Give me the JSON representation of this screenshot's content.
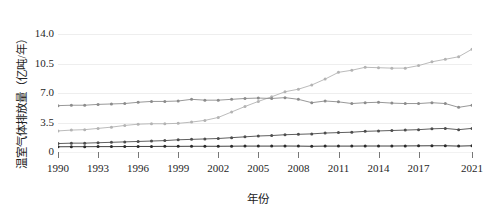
{
  "chart_data": {
    "type": "line",
    "title": "",
    "xlabel": "年份",
    "ylabel": "温室气体排放量（亿吨/年）",
    "x": [
      1990,
      1991,
      1992,
      1993,
      1994,
      1995,
      1996,
      1997,
      1998,
      1999,
      2000,
      2001,
      2002,
      2003,
      2004,
      2005,
      2006,
      2007,
      2008,
      2009,
      2010,
      2011,
      2012,
      2013,
      2014,
      2015,
      2016,
      2017,
      2018,
      2019,
      2020,
      2021
    ],
    "xlim": [
      1990,
      2021
    ],
    "ylim": [
      0,
      14
    ],
    "yticks": [
      "0",
      "3.5",
      "7.0",
      "10.5",
      "14.0"
    ],
    "ytick_values": [
      0,
      3.5,
      7.0,
      10.5,
      14.0
    ],
    "xticks": [
      "1990",
      "1993",
      "1996",
      "1999",
      "2002",
      "2005",
      "2008",
      "2011",
      "2014",
      "2017",
      "2021"
    ],
    "xtick_values": [
      1990,
      1993,
      1996,
      1999,
      2002,
      2005,
      2008,
      2011,
      2014,
      2017,
      2021
    ],
    "grid": true,
    "grid_axis": "y",
    "legend": "none",
    "marker": "circle",
    "series": [
      {
        "name": "series-1",
        "color": "#b3b3b3",
        "values": [
          2.5,
          2.6,
          2.65,
          2.8,
          2.95,
          3.15,
          3.3,
          3.35,
          3.35,
          3.4,
          3.55,
          3.75,
          4.1,
          4.75,
          5.4,
          6.0,
          6.55,
          7.15,
          7.45,
          7.95,
          8.65,
          9.45,
          9.7,
          10.05,
          10.0,
          9.95,
          9.95,
          10.25,
          10.7,
          11.0,
          11.3,
          12.2
        ]
      },
      {
        "name": "series-2",
        "color": "#8c8c8c",
        "values": [
          5.5,
          5.55,
          5.55,
          5.65,
          5.7,
          5.75,
          5.9,
          6.0,
          6.0,
          6.05,
          6.25,
          6.15,
          6.15,
          6.25,
          6.35,
          6.4,
          6.35,
          6.45,
          6.25,
          5.85,
          6.05,
          5.95,
          5.75,
          5.85,
          5.9,
          5.8,
          5.75,
          5.75,
          5.85,
          5.75,
          5.3,
          5.55
        ]
      },
      {
        "name": "series-3",
        "color": "#4d4d4d",
        "values": [
          1.0,
          1.05,
          1.05,
          1.1,
          1.15,
          1.2,
          1.25,
          1.3,
          1.35,
          1.45,
          1.5,
          1.55,
          1.6,
          1.7,
          1.8,
          1.9,
          1.95,
          2.05,
          2.1,
          2.15,
          2.25,
          2.3,
          2.35,
          2.45,
          2.5,
          2.55,
          2.6,
          2.65,
          2.75,
          2.8,
          2.65,
          2.8
        ]
      },
      {
        "name": "series-4",
        "color": "#2b2b2b",
        "values": [
          0.62,
          0.63,
          0.63,
          0.64,
          0.64,
          0.65,
          0.66,
          0.66,
          0.67,
          0.67,
          0.68,
          0.68,
          0.68,
          0.69,
          0.7,
          0.7,
          0.7,
          0.71,
          0.7,
          0.68,
          0.7,
          0.7,
          0.7,
          0.71,
          0.71,
          0.71,
          0.72,
          0.73,
          0.74,
          0.74,
          0.7,
          0.74
        ]
      }
    ]
  }
}
